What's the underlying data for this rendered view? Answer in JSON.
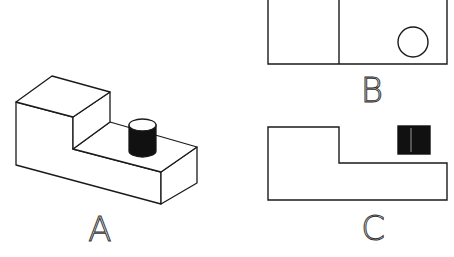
{
  "figure": {
    "views": [
      {
        "id": "A",
        "label": "A",
        "description": "isometric view of stepped block with cylinder"
      },
      {
        "id": "B",
        "label": "B",
        "description": "top view with circle"
      },
      {
        "id": "C",
        "label": "C",
        "description": "front view with filled square"
      }
    ]
  },
  "colors": {
    "line": "#1a1a1a",
    "fill_dark": "#111111",
    "background": "#ffffff"
  }
}
